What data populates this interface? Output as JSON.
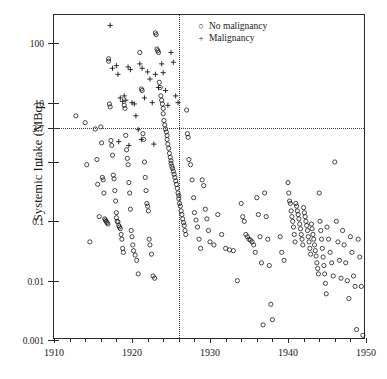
{
  "chart_data": {
    "type": "scatter",
    "title": "",
    "xlabel": "",
    "ylabel": "Systemic Intake (MBq)",
    "xlim": [
      1910,
      1950
    ],
    "ylim": [
      0.001,
      300
    ],
    "yscale": "log",
    "xticks": [
      1910,
      1920,
      1930,
      1940,
      1950
    ],
    "xticklabels": [
      "1910",
      "1920",
      "1930",
      "1940",
      "1950"
    ],
    "xminor_step": 2,
    "yticks": [
      100,
      10,
      3.7,
      1,
      0.1,
      0.01,
      0.001
    ],
    "yticklabels": [
      "100",
      "10",
      "3.7",
      "1",
      "0.1",
      "0.01",
      "0.001"
    ],
    "grid": false,
    "legend_position": "top-right",
    "annotations": [
      {
        "kind": "hline",
        "y": 3.7,
        "style": "dotted",
        "label": "3.7"
      },
      {
        "kind": "vline",
        "x": 1926,
        "style": "dotted",
        "label": "1926"
      }
    ],
    "series": [
      {
        "name": "No malignancy",
        "marker": "o",
        "color": "#1a1a1a",
        "points": [
          [
            1912.8,
            6.0
          ],
          [
            1914.0,
            4.6
          ],
          [
            1914.2,
            0.9
          ],
          [
            1914.6,
            0.045
          ],
          [
            1915.3,
            3.6
          ],
          [
            1915.5,
            1.1
          ],
          [
            1915.6,
            0.42
          ],
          [
            1915.8,
            0.12
          ],
          [
            1916.0,
            3.9
          ],
          [
            1916.1,
            2.1
          ],
          [
            1916.2,
            0.55
          ],
          [
            1916.3,
            0.5
          ],
          [
            1916.4,
            0.3
          ],
          [
            1916.5,
            0.11
          ],
          [
            1916.6,
            0.105
          ],
          [
            1916.7,
            0.1
          ],
          [
            1916.8,
            0.095
          ],
          [
            1916.9,
            0.09
          ],
          [
            1917.0,
            55
          ],
          [
            1917.0,
            50
          ],
          [
            1917.1,
            9.5
          ],
          [
            1917.2,
            8.5
          ],
          [
            1917.3,
            2.3
          ],
          [
            1917.4,
            1.9
          ],
          [
            1917.5,
            1.3
          ],
          [
            1917.6,
            0.6
          ],
          [
            1917.7,
            0.52
          ],
          [
            1917.8,
            0.33
          ],
          [
            1917.9,
            0.22
          ],
          [
            1918.0,
            0.14
          ],
          [
            1918.0,
            0.115
          ],
          [
            1918.1,
            0.1
          ],
          [
            1918.2,
            0.098
          ],
          [
            1918.3,
            0.085
          ],
          [
            1918.4,
            0.08
          ],
          [
            1918.5,
            0.075
          ],
          [
            1918.6,
            0.06
          ],
          [
            1918.7,
            0.05
          ],
          [
            1918.8,
            0.035
          ],
          [
            1918.9,
            0.03
          ],
          [
            1919.0,
            9.0
          ],
          [
            1919.1,
            8.0
          ],
          [
            1919.2,
            2.8
          ],
          [
            1919.3,
            1.6
          ],
          [
            1919.4,
            1.15
          ],
          [
            1919.5,
            0.9
          ],
          [
            1919.6,
            0.45
          ],
          [
            1919.7,
            0.3
          ],
          [
            1919.8,
            0.16
          ],
          [
            1919.9,
            0.07
          ],
          [
            1920.0,
            0.055
          ],
          [
            1920.1,
            0.04
          ],
          [
            1920.2,
            0.032
          ],
          [
            1920.4,
            0.027
          ],
          [
            1920.6,
            0.022
          ],
          [
            1920.8,
            0.013
          ],
          [
            1921.0,
            70
          ],
          [
            1921.2,
            17
          ],
          [
            1921.3,
            16
          ],
          [
            1921.4,
            3.0
          ],
          [
            1921.5,
            2.4
          ],
          [
            1921.6,
            1.0
          ],
          [
            1921.7,
            0.55
          ],
          [
            1921.8,
            0.33
          ],
          [
            1921.9,
            0.2
          ],
          [
            1922.0,
            0.18
          ],
          [
            1922.1,
            0.15
          ],
          [
            1922.2,
            0.05
          ],
          [
            1922.3,
            0.04
          ],
          [
            1922.5,
            0.028
          ],
          [
            1922.7,
            0.012
          ],
          [
            1922.9,
            0.011
          ],
          [
            1923.0,
            150
          ],
          [
            1923.1,
            140
          ],
          [
            1923.2,
            80
          ],
          [
            1923.3,
            75
          ],
          [
            1923.4,
            70
          ],
          [
            1923.5,
            22
          ],
          [
            1923.6,
            18
          ],
          [
            1923.7,
            13
          ],
          [
            1923.8,
            11
          ],
          [
            1923.9,
            9.5
          ],
          [
            1924.0,
            8.0
          ],
          [
            1924.0,
            6.5
          ],
          [
            1924.1,
            5.0
          ],
          [
            1924.2,
            4.2
          ],
          [
            1924.3,
            3.6
          ],
          [
            1924.4,
            3.2
          ],
          [
            1924.5,
            2.8
          ],
          [
            1924.5,
            2.4
          ],
          [
            1924.6,
            2.0
          ],
          [
            1924.7,
            1.7
          ],
          [
            1924.8,
            1.4
          ],
          [
            1924.9,
            1.2
          ],
          [
            1925.0,
            1.05
          ],
          [
            1925.0,
            0.95
          ],
          [
            1925.1,
            0.85
          ],
          [
            1925.2,
            0.78
          ],
          [
            1925.3,
            0.7
          ],
          [
            1925.4,
            0.62
          ],
          [
            1925.5,
            0.55
          ],
          [
            1925.6,
            0.48
          ],
          [
            1925.7,
            0.42
          ],
          [
            1925.8,
            0.36
          ],
          [
            1925.9,
            0.3
          ],
          [
            1926.0,
            0.27
          ],
          [
            1926.0,
            0.24
          ],
          [
            1926.1,
            0.2
          ],
          [
            1926.2,
            0.18
          ],
          [
            1926.3,
            0.15
          ],
          [
            1926.4,
            0.13
          ],
          [
            1926.5,
            0.11
          ],
          [
            1926.6,
            0.095
          ],
          [
            1926.7,
            0.085
          ],
          [
            1926.8,
            0.07
          ],
          [
            1926.9,
            0.06
          ],
          [
            1927.0,
            7.5
          ],
          [
            1927.1,
            3.0
          ],
          [
            1927.2,
            2.6
          ],
          [
            1927.3,
            1.1
          ],
          [
            1927.5,
            0.9
          ],
          [
            1927.7,
            0.5
          ],
          [
            1927.9,
            0.25
          ],
          [
            1928.0,
            0.14
          ],
          [
            1928.2,
            0.105
          ],
          [
            1928.4,
            0.08
          ],
          [
            1928.6,
            0.05
          ],
          [
            1928.8,
            0.035
          ],
          [
            1929.0,
            0.5
          ],
          [
            1929.2,
            0.4
          ],
          [
            1929.4,
            0.16
          ],
          [
            1929.6,
            0.11
          ],
          [
            1929.8,
            0.07
          ],
          [
            1930.0,
            0.045
          ],
          [
            1930.5,
            0.04
          ],
          [
            1931.0,
            0.13
          ],
          [
            1931.5,
            0.06
          ],
          [
            1932.0,
            0.035
          ],
          [
            1932.5,
            0.033
          ],
          [
            1933.0,
            0.032
          ],
          [
            1933.5,
            0.01
          ],
          [
            1934.0,
            0.2
          ],
          [
            1934.2,
            0.12
          ],
          [
            1934.4,
            0.1
          ],
          [
            1934.6,
            0.06
          ],
          [
            1934.8,
            0.055
          ],
          [
            1935.0,
            0.05
          ],
          [
            1935.2,
            0.048
          ],
          [
            1935.4,
            0.045
          ],
          [
            1935.6,
            0.04
          ],
          [
            1935.8,
            0.03
          ],
          [
            1936.0,
            0.25
          ],
          [
            1936.2,
            0.13
          ],
          [
            1936.4,
            0.055
          ],
          [
            1936.6,
            0.02
          ],
          [
            1936.8,
            0.0018
          ],
          [
            1937.0,
            0.3
          ],
          [
            1937.2,
            0.12
          ],
          [
            1937.4,
            0.05
          ],
          [
            1937.6,
            0.018
          ],
          [
            1937.8,
            0.004
          ],
          [
            1938.0,
            0.0022
          ],
          [
            1939.0,
            0.055
          ],
          [
            1939.2,
            0.03
          ],
          [
            1939.5,
            0.022
          ],
          [
            1940.0,
            0.45
          ],
          [
            1940.1,
            0.3
          ],
          [
            1940.2,
            0.22
          ],
          [
            1940.3,
            0.2
          ],
          [
            1940.4,
            0.15
          ],
          [
            1940.5,
            0.12
          ],
          [
            1940.6,
            0.1
          ],
          [
            1940.7,
            0.08
          ],
          [
            1940.8,
            0.06
          ],
          [
            1940.9,
            0.045
          ],
          [
            1941.0,
            0.2
          ],
          [
            1941.1,
            0.18
          ],
          [
            1941.2,
            0.15
          ],
          [
            1941.3,
            0.13
          ],
          [
            1941.4,
            0.11
          ],
          [
            1941.5,
            0.09
          ],
          [
            1941.6,
            0.075
          ],
          [
            1941.7,
            0.06
          ],
          [
            1941.8,
            0.05
          ],
          [
            1941.9,
            0.04
          ],
          [
            1942.0,
            0.17
          ],
          [
            1942.1,
            0.14
          ],
          [
            1942.2,
            0.12
          ],
          [
            1942.3,
            0.1
          ],
          [
            1942.4,
            0.085
          ],
          [
            1942.5,
            0.07
          ],
          [
            1942.6,
            0.055
          ],
          [
            1942.7,
            0.045
          ],
          [
            1942.8,
            0.035
          ],
          [
            1942.9,
            0.028
          ],
          [
            1943.0,
            0.09
          ],
          [
            1943.1,
            0.075
          ],
          [
            1943.2,
            0.06
          ],
          [
            1943.3,
            0.05
          ],
          [
            1943.4,
            0.04
          ],
          [
            1943.5,
            0.032
          ],
          [
            1943.6,
            0.026
          ],
          [
            1943.7,
            0.02
          ],
          [
            1943.8,
            0.016
          ],
          [
            1943.9,
            0.013
          ],
          [
            1944.0,
            0.3
          ],
          [
            1944.1,
            0.1
          ],
          [
            1944.2,
            0.07
          ],
          [
            1944.3,
            0.05
          ],
          [
            1944.4,
            0.035
          ],
          [
            1944.5,
            0.025
          ],
          [
            1944.6,
            0.018
          ],
          [
            1944.7,
            0.013
          ],
          [
            1944.8,
            0.009
          ],
          [
            1944.9,
            0.006
          ],
          [
            1945.0,
            0.08
          ],
          [
            1945.2,
            0.05
          ],
          [
            1945.4,
            0.03
          ],
          [
            1945.6,
            0.02
          ],
          [
            1945.8,
            0.012
          ],
          [
            1946.0,
            1.0
          ],
          [
            1946.2,
            0.1
          ],
          [
            1946.4,
            0.045
          ],
          [
            1946.6,
            0.022
          ],
          [
            1946.8,
            0.011
          ],
          [
            1947.0,
            0.07
          ],
          [
            1947.2,
            0.04
          ],
          [
            1947.4,
            0.02
          ],
          [
            1947.6,
            0.01
          ],
          [
            1947.8,
            0.005
          ],
          [
            1948.0,
            0.055
          ],
          [
            1948.2,
            0.03
          ],
          [
            1948.4,
            0.012
          ],
          [
            1948.6,
            0.008
          ],
          [
            1948.8,
            0.0015
          ],
          [
            1949.0,
            0.05
          ],
          [
            1949.2,
            0.025
          ],
          [
            1949.4,
            0.008
          ],
          [
            1949.6,
            0.0012
          ]
        ]
      },
      {
        "name": "Malignancy",
        "marker": "+",
        "color": "#1a1a1a",
        "points": [
          [
            1917.2,
            200
          ],
          [
            1917.5,
            38
          ],
          [
            1918.0,
            42
          ],
          [
            1918.2,
            30
          ],
          [
            1918.5,
            12
          ],
          [
            1918.8,
            10.5
          ],
          [
            1919.0,
            13
          ],
          [
            1919.2,
            11
          ],
          [
            1919.5,
            40
          ],
          [
            1919.8,
            36
          ],
          [
            1920.0,
            10
          ],
          [
            1920.3,
            9.5
          ],
          [
            1920.5,
            6.0
          ],
          [
            1920.8,
            3.5
          ],
          [
            1921.0,
            45
          ],
          [
            1921.3,
            38
          ],
          [
            1921.6,
            12
          ],
          [
            1922.0,
            33
          ],
          [
            1922.3,
            25
          ],
          [
            1922.6,
            10
          ],
          [
            1923.0,
            30
          ],
          [
            1923.4,
            18
          ],
          [
            1923.8,
            45
          ],
          [
            1924.0,
            32
          ],
          [
            1924.3,
            16
          ],
          [
            1924.6,
            9.0
          ],
          [
            1925.0,
            70
          ],
          [
            1925.3,
            48
          ],
          [
            1925.6,
            13
          ],
          [
            1925.9,
            10
          ],
          [
            1918.3,
            2.2
          ],
          [
            1919.6,
            1.9
          ],
          [
            1921.2,
            2.4
          ],
          [
            1922.8,
            2.0
          ]
        ]
      }
    ]
  },
  "legend": {
    "items": [
      {
        "marker": "o",
        "label": "No malignancy"
      },
      {
        "marker": "+",
        "label": "Malignancy"
      }
    ]
  }
}
